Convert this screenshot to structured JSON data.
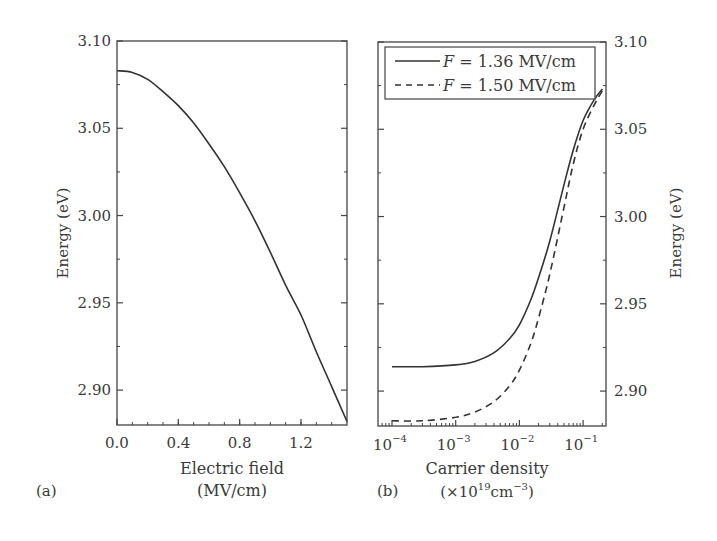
{
  "chart_data": [
    {
      "panel": "(a)",
      "type": "line",
      "title": "",
      "xlabel": "Electric field",
      "xlabel_unit": "(MV/cm)",
      "ylabel": "Energy (eV)",
      "xlim": [
        0.0,
        1.5
      ],
      "ylim": [
        2.88,
        3.1
      ],
      "xticks": [
        "0.0",
        "0.4",
        "0.8",
        "1.2"
      ],
      "yticks": [
        "3.10",
        "3.05",
        "3.00",
        "2.95",
        "2.90"
      ],
      "grid": false,
      "series": [
        {
          "name": "Energy vs field",
          "style": "solid",
          "x": [
            0.0,
            0.1,
            0.2,
            0.3,
            0.4,
            0.5,
            0.6,
            0.7,
            0.8,
            0.9,
            1.0,
            1.1,
            1.2,
            1.3,
            1.4,
            1.5
          ],
          "y": [
            3.083,
            3.082,
            3.078,
            3.071,
            3.063,
            3.053,
            3.041,
            3.028,
            3.013,
            2.997,
            2.979,
            2.96,
            2.943,
            2.922,
            2.902,
            2.882
          ]
        }
      ]
    },
    {
      "panel": "(b)",
      "type": "line",
      "title": "",
      "xlabel": "Carrier density",
      "xlabel_unit": "(×10¹⁹cm⁻³)",
      "ylabel": "Energy (eV)",
      "xscale": "log",
      "xlim": [
        6e-05,
        0.2
      ],
      "ylim": [
        2.88,
        3.1
      ],
      "xticks": [
        "10⁻⁴",
        "10⁻³",
        "10⁻²",
        "10⁻¹"
      ],
      "yticks": [
        "3.10",
        "3.05",
        "3.00",
        "2.95",
        "2.90"
      ],
      "yaxis_side": "right",
      "grid": false,
      "legend_position": "upper left",
      "series": [
        {
          "name": "F = 1.36 MV/cm",
          "style": "solid",
          "x": [
            0.0001,
            0.0003,
            0.001,
            0.002,
            0.004,
            0.007,
            0.01,
            0.015,
            0.02,
            0.03,
            0.05,
            0.07,
            0.1,
            0.15,
            0.2
          ],
          "y": [
            2.914,
            2.914,
            2.915,
            2.917,
            2.922,
            2.93,
            2.938,
            2.952,
            2.965,
            2.986,
            3.018,
            3.038,
            3.055,
            3.067,
            3.073
          ]
        },
        {
          "name": "F = 1.50 MV/cm",
          "style": "dashed",
          "x": [
            0.0001,
            0.0003,
            0.001,
            0.002,
            0.004,
            0.007,
            0.01,
            0.015,
            0.02,
            0.03,
            0.05,
            0.07,
            0.1,
            0.15,
            0.2
          ],
          "y": [
            2.883,
            2.883,
            2.885,
            2.888,
            2.894,
            2.903,
            2.912,
            2.927,
            2.942,
            2.967,
            3.005,
            3.03,
            3.05,
            3.064,
            3.072
          ]
        }
      ]
    }
  ],
  "panels": {
    "a": {
      "label": "(a)",
      "xlabel": "Electric field",
      "xlabel_unit": "(MV/cm)",
      "ylabel": "Energy (eV)",
      "xticks": [
        "0.0",
        "0.4",
        "0.8",
        "1.2"
      ],
      "yticks": [
        "3.10",
        "3.05",
        "3.00",
        "2.95",
        "2.90"
      ]
    },
    "b": {
      "label": "(b)",
      "xlabel": "Carrier density",
      "xlabel_unit_prefix": "(×10",
      "xlabel_unit_exp": "19",
      "xlabel_unit_mid": "cm",
      "xlabel_unit_exp2": "−3",
      "xlabel_unit_suffix": ")",
      "ylabel": "Energy (eV)",
      "xtick_base": "10",
      "xtick_exps": [
        "−4",
        "−3",
        "−2",
        "−1"
      ],
      "yticks": [
        "3.10",
        "3.05",
        "3.00",
        "2.95",
        "2.90"
      ],
      "legend": [
        {
          "var": "F",
          "text": " = 1.36 MV/cm",
          "style": "solid"
        },
        {
          "var": "F",
          "text": " = 1.50 MV/cm",
          "style": "dashed"
        }
      ]
    }
  },
  "colors": {
    "line": "#333333",
    "axis": "#444444",
    "background": "#ffffff"
  }
}
